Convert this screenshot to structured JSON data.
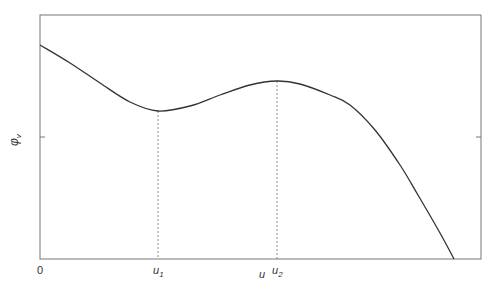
{
  "chart_data": {
    "type": "line",
    "title": "",
    "xlabel": "u",
    "ylabel": "φ_v",
    "x_tick_labels": [
      "0",
      "u1",
      "u2"
    ],
    "y_tick_labels": [],
    "annotations": [
      {
        "label": "u1",
        "description": "local minimum of curve, dotted vertical line"
      },
      {
        "label": "u2",
        "description": "local maximum of curve, dotted vertical line"
      }
    ],
    "grid": false,
    "legend": null,
    "series": [
      {
        "name": "φ_v(u)",
        "points_px": [
          [
            40,
            45
          ],
          [
            70,
            63
          ],
          [
            100,
            83
          ],
          [
            130,
            102
          ],
          [
            158,
            111
          ],
          [
            190,
            106
          ],
          [
            220,
            95
          ],
          [
            250,
            85
          ],
          [
            277,
            81
          ],
          [
            300,
            84
          ],
          [
            330,
            95
          ],
          [
            350,
            105
          ],
          [
            375,
            130
          ],
          [
            400,
            165
          ],
          [
            418,
            195
          ],
          [
            440,
            233
          ],
          [
            454,
            259
          ]
        ],
        "x_relative": [
          0,
          0.068,
          0.136,
          0.204,
          0.268,
          0.34,
          0.408,
          0.476,
          0.537,
          0.59,
          0.658,
          0.703,
          0.76,
          0.816,
          0.857,
          0.907,
          0.939
        ],
        "y_relative": [
          0.87,
          0.79,
          0.71,
          0.64,
          0.6,
          0.62,
          0.67,
          0.71,
          0.72,
          0.71,
          0.67,
          0.63,
          0.53,
          0.39,
          0.26,
          0.11,
          0.0
        ]
      }
    ],
    "critical_points": {
      "u1": {
        "x_px": 158,
        "y_px": 111,
        "type": "minimum"
      },
      "u2": {
        "x_px": 277,
        "y_px": 81,
        "type": "maximum"
      }
    }
  },
  "axes": {
    "x_origin_label": "0",
    "x_label": "u",
    "u1_label": "u",
    "u1_sub": "1",
    "u2_label": "u",
    "u2_sub": "2",
    "y_label": "φ",
    "y_sub": "v"
  },
  "colors": {
    "curve": "#333333",
    "frame": "#777777",
    "dotted": "#888888"
  }
}
